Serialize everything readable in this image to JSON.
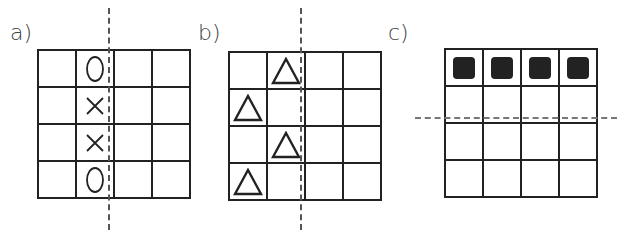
{
  "panels": [
    {
      "label": "a)",
      "rows": 4,
      "cols": 4,
      "symmetry_line": {
        "orientation": "vertical",
        "after_col": 2,
        "style": "dashed"
      },
      "cells": [
        [
          "",
          "O",
          "",
          ""
        ],
        [
          "",
          "X",
          "",
          ""
        ],
        [
          "",
          "X",
          "",
          ""
        ],
        [
          "",
          "O",
          "",
          ""
        ]
      ]
    },
    {
      "label": "b)",
      "rows": 4,
      "cols": 4,
      "symmetry_line": {
        "orientation": "vertical",
        "after_col": 2,
        "style": "dashed"
      },
      "cells": [
        [
          "",
          "triangle",
          "",
          ""
        ],
        [
          "triangle",
          "",
          "",
          ""
        ],
        [
          "",
          "triangle",
          "",
          ""
        ],
        [
          "triangle",
          "",
          "",
          ""
        ]
      ]
    },
    {
      "label": "c)",
      "rows": 4,
      "cols": 4,
      "symmetry_line": {
        "orientation": "horizontal",
        "after_row": 2,
        "style": "dashed"
      },
      "cells": [
        [
          "filled-square",
          "filled-square",
          "filled-square",
          "filled-square"
        ],
        [
          "",
          "",
          "",
          ""
        ],
        [
          "",
          "",
          "",
          ""
        ],
        [
          "",
          "",
          "",
          ""
        ]
      ]
    }
  ],
  "colors": {
    "grid_line": "#222222",
    "dash_line": "#555555",
    "filled_square": "#222222"
  }
}
